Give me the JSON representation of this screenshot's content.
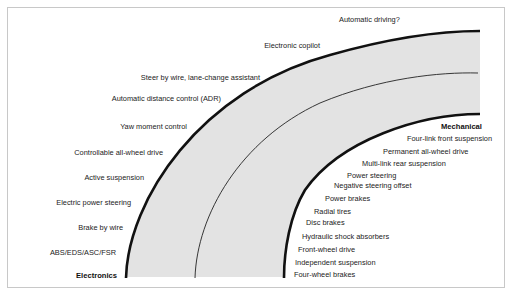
{
  "diagram": {
    "type": "evolution-arc",
    "band_color": "#e3e3e3",
    "line_color": "#111111",
    "top_label": "Automatic driving?",
    "electronics": {
      "heading": "Electronics",
      "items": [
        "Electronic copilot",
        "Steer by wire, lane-change assistant",
        "Automatic distance control (ADR)",
        "Yaw moment control",
        "Controllable all-wheel drive",
        "Active suspension",
        "Electric power steering",
        "Brake by wire",
        "ABS/EDS/ASC/FSR"
      ]
    },
    "mechanical": {
      "heading": "Mechanical",
      "items": [
        "Four-link front suspension",
        "Permanent all-wheel drive",
        "Multi-link rear suspension",
        "Power steering",
        "Negative steering offset",
        "Power brakes",
        "Radial tires",
        "Disc brakes",
        "Hydraulic shock absorbers",
        "Front-wheel drive",
        "Independent suspension",
        "Four-wheel brakes"
      ]
    }
  }
}
